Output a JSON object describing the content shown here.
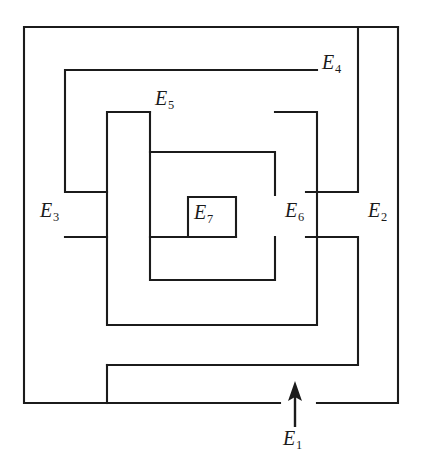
{
  "figure": {
    "kind": "labyrinth-diagram",
    "width": 422,
    "height": 462,
    "background_color": "#ffffff",
    "line_color": "#1b1b1b"
  },
  "labels": [
    {
      "id": "e1",
      "base": "E",
      "sub": "1",
      "text": "E1",
      "role": "entrance-region"
    },
    {
      "id": "e2",
      "base": "E",
      "sub": "2",
      "text": "E2",
      "role": "corridor-region"
    },
    {
      "id": "e3",
      "base": "E",
      "sub": "3",
      "text": "E3",
      "role": "corridor-region"
    },
    {
      "id": "e4",
      "base": "E",
      "sub": "4",
      "text": "E4",
      "role": "corridor-region"
    },
    {
      "id": "e5",
      "base": "E",
      "sub": "5",
      "text": "E5",
      "role": "corridor-region"
    },
    {
      "id": "e6",
      "base": "E",
      "sub": "6",
      "text": "E6",
      "role": "corridor-region"
    },
    {
      "id": "e7",
      "base": "E",
      "sub": "7",
      "text": "E7",
      "role": "center-region"
    }
  ],
  "arrow": {
    "name": "entrance-arrow",
    "direction": "up",
    "x": 295,
    "tail_y": 427,
    "tip_y": 381
  },
  "walls": [
    {
      "name": "outer-boundary",
      "d": "M 398 27 L 24 27 L 24 403 L 280 403"
    },
    {
      "name": "outer-boundary-right",
      "d": "M 398 27 L 398 403 L 317 403"
    },
    {
      "name": "ring2-top-left",
      "d": "M 358 27 L 358 192 L 306 192"
    },
    {
      "name": "ring2-outer",
      "d": "M 317 70 L 65 70 L 65 192 L 107 192"
    },
    {
      "name": "ring2-lower",
      "d": "M 107 365 L 358 365 L 358 237 L 306 237"
    },
    {
      "name": "ring3-top",
      "d": "M 275 112 L 317 112 L 317 325 L 107 325 L 107 112 L 150 112"
    },
    {
      "name": "ring3-left-stub",
      "d": "M 65 237 L 107 237"
    },
    {
      "name": "ring4",
      "d": "M 150 152 L 275 152 L 275 195"
    },
    {
      "name": "ring4-left",
      "d": "M 150 112 L 150 280 L 275 280 L 275 237"
    },
    {
      "name": "center-feed",
      "d": "M 150 237 L 236 237"
    },
    {
      "name": "center-box-e7",
      "d": "M 188 237 L 188 197 L 236 197 L 236 237"
    },
    {
      "name": "bottom-spur",
      "d": "M 107 365 L 107 403"
    },
    {
      "name": "gap-wall-left",
      "d": "M 24 403 L 24 403"
    }
  ]
}
